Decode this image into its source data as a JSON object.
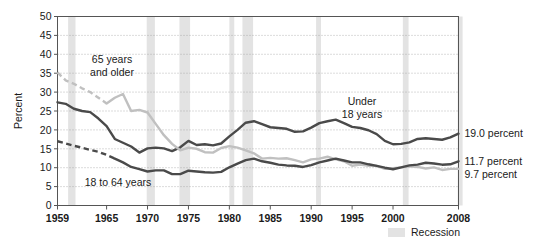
{
  "chart_data": {
    "type": "line",
    "title": "",
    "xlabel": "",
    "ylabel": "Percent",
    "ylim": [
      0,
      50
    ],
    "xlim": [
      1959,
      2008
    ],
    "ytick_labels": [
      "0",
      "5",
      "10",
      "15",
      "20",
      "25",
      "30",
      "35",
      "40",
      "45",
      "50"
    ],
    "ytick_values": [
      0,
      5,
      10,
      15,
      20,
      25,
      30,
      35,
      40,
      45,
      50
    ],
    "xtick_labels": [
      "1959",
      "1965",
      "1970",
      "1975",
      "1980",
      "1985",
      "1990",
      "1995",
      "2000",
      "2008"
    ],
    "xtick_values": [
      1959,
      1965,
      1970,
      1975,
      1980,
      1985,
      1990,
      1995,
      2000,
      2008
    ],
    "grid": "horizontal-dotted",
    "legend_position": "bottom-right",
    "x": [
      1959,
      1960,
      1961,
      1962,
      1963,
      1964,
      1965,
      1966,
      1967,
      1968,
      1969,
      1970,
      1971,
      1972,
      1973,
      1974,
      1975,
      1976,
      1977,
      1978,
      1979,
      1980,
      1981,
      1982,
      1983,
      1984,
      1985,
      1986,
      1987,
      1988,
      1989,
      1990,
      1991,
      1992,
      1993,
      1994,
      1995,
      1996,
      1997,
      1998,
      1999,
      2000,
      2001,
      2002,
      2003,
      2004,
      2005,
      2006,
      2007,
      2008
    ],
    "series": [
      {
        "name": "Under 18 years",
        "color": "#4a4a4a",
        "style": "solid",
        "end_label": "19.0 percent",
        "end_value": 19.0,
        "values": [
          27.3,
          26.9,
          25.6,
          25.0,
          24.7,
          23.0,
          21.0,
          17.6,
          16.6,
          15.6,
          14.0,
          15.1,
          15.3,
          15.1,
          14.4,
          15.4,
          17.1,
          16.0,
          16.2,
          15.9,
          16.4,
          18.3,
          20.0,
          21.9,
          22.3,
          21.5,
          20.7,
          20.5,
          20.3,
          19.5,
          19.6,
          20.6,
          21.8,
          22.3,
          22.7,
          21.8,
          20.8,
          20.5,
          19.9,
          18.9,
          17.1,
          16.2,
          16.3,
          16.7,
          17.6,
          17.8,
          17.6,
          17.4,
          18.0,
          19.0
        ]
      },
      {
        "name": "65 years and older",
        "color": "#c0c0c0",
        "style": "dashed-then-solid",
        "dash_until": 1965,
        "end_label": "9.7 percent",
        "end_value": 9.7,
        "values": [
          35.2,
          33.1,
          32.2,
          31.0,
          30.0,
          28.5,
          27.0,
          28.5,
          29.5,
          25.0,
          25.3,
          24.6,
          21.6,
          18.6,
          16.3,
          14.6,
          15.3,
          15.0,
          14.1,
          14.0,
          15.2,
          15.7,
          15.3,
          14.6,
          13.8,
          12.4,
          12.6,
          12.4,
          12.5,
          12.0,
          11.4,
          12.2,
          12.4,
          12.9,
          12.2,
          11.7,
          10.5,
          10.8,
          10.5,
          10.5,
          9.7,
          9.9,
          10.1,
          10.4,
          10.2,
          9.8,
          10.1,
          9.4,
          9.7,
          9.7
        ]
      },
      {
        "name": "18 to 64 years",
        "color": "#4a4a4a",
        "style": "dashed-then-solid",
        "dash_until": 1966,
        "end_label": "11.7 percent",
        "end_value": 11.7,
        "values": [
          17.0,
          16.4,
          15.8,
          15.3,
          14.7,
          14.2,
          13.4,
          12.4,
          11.4,
          10.2,
          9.6,
          9.0,
          9.3,
          9.3,
          8.3,
          8.3,
          9.2,
          9.0,
          8.8,
          8.7,
          8.9,
          10.1,
          11.1,
          12.0,
          12.4,
          11.7,
          11.3,
          10.8,
          10.6,
          10.5,
          10.2,
          10.7,
          11.4,
          11.9,
          12.4,
          11.9,
          11.4,
          11.4,
          10.9,
          10.5,
          10.0,
          9.6,
          10.1,
          10.6,
          10.8,
          11.3,
          11.1,
          10.8,
          10.9,
          11.7
        ]
      }
    ],
    "recessions": [
      {
        "start": 1960.3,
        "end": 1961.2
      },
      {
        "start": 1969.9,
        "end": 1970.9
      },
      {
        "start": 1973.9,
        "end": 1975.2
      },
      {
        "start": 1980.0,
        "end": 1980.6
      },
      {
        "start": 1981.6,
        "end": 1982.9
      },
      {
        "start": 1990.6,
        "end": 1991.2
      },
      {
        "start": 2001.2,
        "end": 2001.9
      },
      {
        "start": 2007.9,
        "end": 2008.5
      }
    ],
    "recession_color": "#e3e3e3",
    "annotations": [
      {
        "name": "label-65-and-older-line1",
        "text": "65 years",
        "x": 112,
        "y": 63
      },
      {
        "name": "label-65-and-older-line2",
        "text": "and older",
        "x": 112,
        "y": 76
      },
      {
        "name": "label-18-to-64",
        "text": "18 to 64 years",
        "x": 118,
        "y": 186
      },
      {
        "name": "label-under-18-line1",
        "text": "Under",
        "x": 362,
        "y": 105
      },
      {
        "name": "label-under-18-line2",
        "text": "18 years",
        "x": 362,
        "y": 118
      }
    ],
    "legend": {
      "swatch_label": "Recession",
      "swatch_color": "#e3e3e3"
    }
  }
}
